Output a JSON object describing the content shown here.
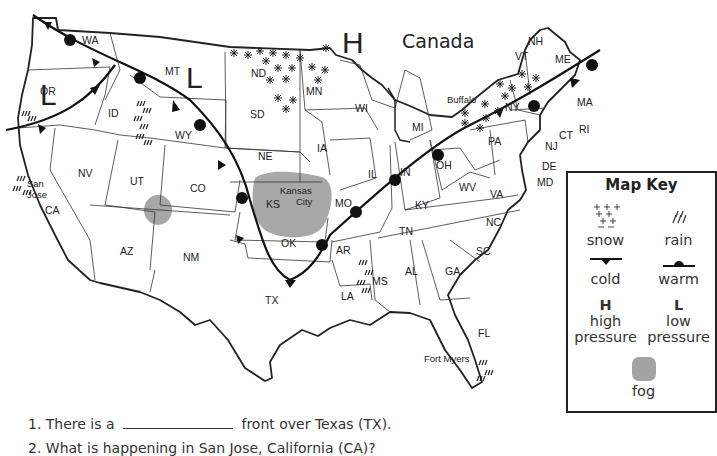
{
  "map": {
    "country_label": "Canada",
    "pressure_labels": [
      {
        "symbol": "H",
        "meaning": "high pressure",
        "location": "north of Minnesota"
      },
      {
        "symbol": "L",
        "meaning": "low pressure",
        "location": "Oregon"
      },
      {
        "symbol": "L",
        "meaning": "low pressure",
        "location": "Montana"
      }
    ],
    "states": [
      "WA",
      "OR",
      "CA",
      "NV",
      "ID",
      "MT",
      "WY",
      "UT",
      "CO",
      "AZ",
      "NM",
      "ND",
      "SD",
      "NE",
      "KS",
      "OK",
      "TX",
      "MN",
      "IA",
      "MO",
      "AR",
      "LA",
      "WI",
      "IL",
      "MI",
      "IN",
      "OH",
      "KY",
      "TN",
      "MS",
      "AL",
      "GA",
      "FL",
      "SC",
      "NC",
      "VA",
      "WV",
      "PA",
      "NY",
      "VT",
      "NH",
      "ME",
      "MA",
      "RI",
      "CT",
      "NJ",
      "DE",
      "MD"
    ],
    "cities": [
      "San Jose",
      "Kansas City",
      "Buffalo",
      "Fort Myers"
    ],
    "weather": {
      "snow": [
        "ND",
        "MN",
        "SD",
        "NY",
        "VT"
      ],
      "rain": [
        "OR",
        "ID",
        "San Jose",
        "MS",
        "Fort Myers"
      ],
      "fog": [
        "Kansas City / KS",
        "Four Corners (UT/CO/AZ/NM)"
      ],
      "cold_fronts": [
        "Pacific NW through OR",
        "WA through WY, CO, OK, TX",
        "PA to MA"
      ],
      "warm_fronts": [
        "WA through MT, WY, CO",
        "AR, MO, IN, OH, NY, ME"
      ]
    }
  },
  "key": {
    "title": "Map Key",
    "items": [
      {
        "label": "snow",
        "icon": "snow-icon"
      },
      {
        "label": "rain",
        "icon": "rain-icon"
      },
      {
        "label": "cold",
        "icon": "cold-front-icon"
      },
      {
        "label": "warm",
        "icon": "warm-front-icon"
      },
      {
        "symbol": "H",
        "label1": "high",
        "label2": "pressure"
      },
      {
        "symbol": "L",
        "label1": "low",
        "label2": "pressure"
      },
      {
        "label": "fog",
        "icon": "fog-icon"
      }
    ]
  },
  "questions": [
    {
      "number": "1.",
      "before": "There is a",
      "after": "front over Texas (TX)."
    },
    {
      "number": "2.",
      "text": "What is happening in San Jose, California (CA)?"
    }
  ]
}
